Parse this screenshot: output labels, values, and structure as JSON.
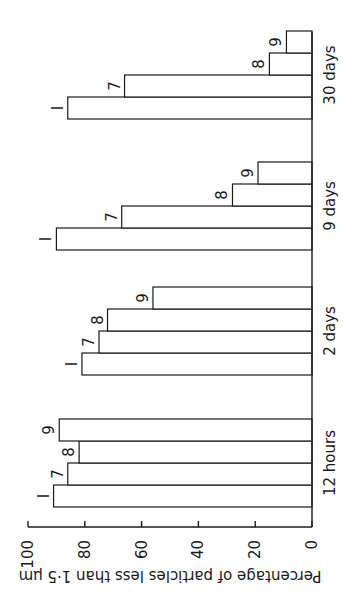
{
  "chart_data": {
    "type": "bar",
    "orientation": "rotated 90° (value axis horizontal at bottom, text rotated)",
    "title": "",
    "xlabel": "",
    "ylabel": "Percentage of particles less than 1·5 μm",
    "ylim": [
      0,
      100
    ],
    "yticks": [
      "0",
      "20",
      "40",
      "60",
      "80",
      "100"
    ],
    "categories": [
      "12 hours",
      "2 days",
      "9 days",
      "30 days"
    ],
    "series": [
      {
        "name": "I",
        "values": [
          91,
          81,
          90,
          86
        ]
      },
      {
        "name": "7",
        "values": [
          86,
          75,
          67,
          66
        ]
      },
      {
        "name": "8",
        "values": [
          82,
          72,
          28,
          15
        ]
      },
      {
        "name": "9",
        "values": [
          89,
          56,
          19,
          9
        ]
      }
    ],
    "grid": false,
    "legend": "bar labels placed at end of each bar"
  }
}
